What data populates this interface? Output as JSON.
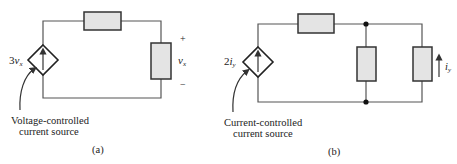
{
  "panels": [
    {
      "id": "a",
      "caption": "(a)",
      "source_label_coef": "3",
      "source_label_var": "v",
      "source_label_sub": "x",
      "annotation_line1": "Voltage-controlled",
      "annotation_line2": "current source",
      "voltage_plus": "+",
      "voltage_minus": "−",
      "voltage_var": "v",
      "voltage_sub": "x"
    },
    {
      "id": "b",
      "caption": "(b)",
      "source_label_coef": "2",
      "source_label_var": "i",
      "source_label_sub": "y",
      "annotation_line1": "Current-controlled",
      "annotation_line2": "current source",
      "current_var": "i",
      "current_sub": "y"
    }
  ],
  "colors": {
    "wire": "#555555",
    "resistor_fill": "#e4e4e4",
    "resistor_stroke": "#333333",
    "node": "#111111"
  }
}
